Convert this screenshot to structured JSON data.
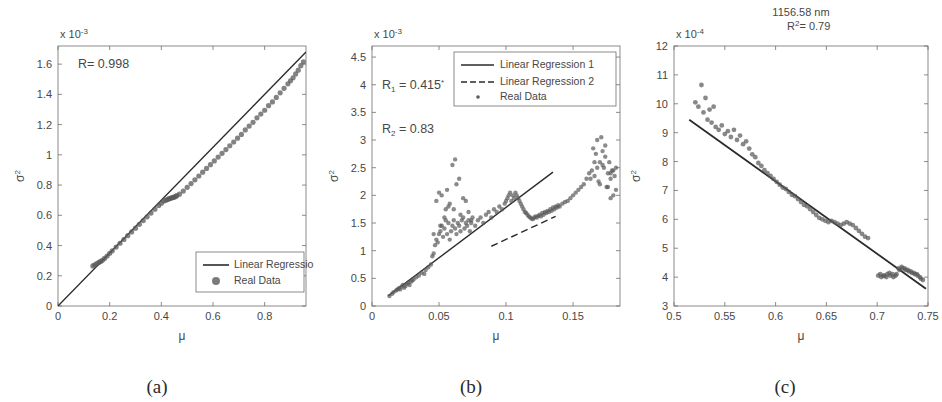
{
  "figure": {
    "background": "#ffffff",
    "axis_color": "#6e6e6e",
    "data_color": "#5a5a5a",
    "line_color": "#2b2b2b"
  },
  "panels": [
    {
      "id": "a",
      "caption": "(a)",
      "exponent_label": "x 10",
      "exponent_sup": "-3",
      "xlabel": "μ",
      "ylabel": "σ",
      "ylabel_sup": "2",
      "annotation": "R= 0.998",
      "xticks": [
        "0",
        "0.2",
        "0.4",
        "0.6",
        "0.8"
      ],
      "yticks": [
        "0",
        "0.2",
        "0.4",
        "0.6",
        "0.8",
        "1",
        "1.2",
        "1.4",
        "1.6"
      ],
      "legend": [
        {
          "label": "Linear Regression",
          "marker": "line"
        },
        {
          "label": "Real Data",
          "marker": "dot"
        }
      ]
    },
    {
      "id": "b",
      "caption": "(b)",
      "exponent_label": "x 10",
      "exponent_sup": "-3",
      "xlabel": "μ",
      "ylabel": "σ",
      "ylabel_sup": "2",
      "annotation_1": "R",
      "annotation_1_sub": "1",
      "annotation_1_val": " = 0.415",
      "annotation_1_mark": "*",
      "annotation_2": "R",
      "annotation_2_sub": "2",
      "annotation_2_val": " = 0.83",
      "xticks": [
        "0",
        "0.05",
        "0.1",
        "0.15"
      ],
      "yticks": [
        "0",
        "0.5",
        "1",
        "1.5",
        "2",
        "2.5",
        "3",
        "3.5",
        "4",
        "4.5"
      ],
      "legend": [
        {
          "label": "Linear Regression 1",
          "marker": "line"
        },
        {
          "label": "Linear Regression 2",
          "marker": "dashed"
        },
        {
          "label": "Real Data",
          "marker": "smalldot"
        }
      ]
    },
    {
      "id": "c",
      "caption": "(c)",
      "title_line1": "1156.58 nm",
      "title_line2": "R",
      "title_line2_sup": "2",
      "title_line2_val": "= 0.79",
      "exponent_label": "x 10",
      "exponent_sup": "-4",
      "xlabel": "μ",
      "ylabel": "σ",
      "ylabel_sup": "2",
      "xticks": [
        "0.5",
        "0.55",
        "0.6",
        "0.65",
        "0.7",
        "0.75"
      ],
      "yticks": [
        "3",
        "4",
        "5",
        "6",
        "7",
        "8",
        "9",
        "10",
        "11",
        "12"
      ]
    }
  ],
  "chart_data": [
    {
      "type": "scatter",
      "panel": "a",
      "title": "",
      "xlabel": "μ",
      "ylabel": "σ²",
      "y_multiplier": 0.001,
      "xlim": [
        0,
        0.96
      ],
      "ylim": [
        0,
        1.72
      ],
      "xticks": [
        0,
        0.2,
        0.4,
        0.6,
        0.8
      ],
      "yticks": [
        0,
        0.2,
        0.4,
        0.6,
        0.8,
        1.0,
        1.2,
        1.4,
        1.6
      ],
      "grid": false,
      "legend_position": "lower-right",
      "annotations": [
        {
          "text": "R= 0.998",
          "x": 0.1,
          "y": 1.6
        }
      ],
      "series": [
        {
          "name": "Linear Regression",
          "type": "line",
          "style": "solid",
          "x": [
            0,
            0.96
          ],
          "y": [
            0.0,
            1.68
          ]
        },
        {
          "name": "Real Data",
          "type": "scatter",
          "x": [
            0.135,
            0.142,
            0.15,
            0.158,
            0.165,
            0.172,
            0.18,
            0.19,
            0.2,
            0.21,
            0.225,
            0.24,
            0.255,
            0.27,
            0.285,
            0.3,
            0.315,
            0.33,
            0.345,
            0.36,
            0.375,
            0.39,
            0.4,
            0.41,
            0.418,
            0.425,
            0.43,
            0.435,
            0.44,
            0.445,
            0.45,
            0.455,
            0.46,
            0.47,
            0.485,
            0.5,
            0.515,
            0.53,
            0.545,
            0.56,
            0.575,
            0.59,
            0.605,
            0.62,
            0.635,
            0.65,
            0.665,
            0.68,
            0.695,
            0.71,
            0.725,
            0.74,
            0.755,
            0.77,
            0.785,
            0.8,
            0.815,
            0.83,
            0.845,
            0.86,
            0.875,
            0.89,
            0.9,
            0.91,
            0.92,
            0.93,
            0.94,
            0.95
          ],
          "y": [
            0.265,
            0.272,
            0.28,
            0.288,
            0.295,
            0.302,
            0.315,
            0.33,
            0.348,
            0.365,
            0.39,
            0.415,
            0.44,
            0.465,
            0.49,
            0.515,
            0.54,
            0.565,
            0.59,
            0.615,
            0.64,
            0.665,
            0.68,
            0.695,
            0.7,
            0.705,
            0.71,
            0.712,
            0.715,
            0.718,
            0.72,
            0.725,
            0.73,
            0.74,
            0.76,
            0.785,
            0.81,
            0.835,
            0.86,
            0.885,
            0.91,
            0.935,
            0.96,
            0.985,
            1.01,
            1.035,
            1.06,
            1.085,
            1.11,
            1.135,
            1.165,
            1.19,
            1.215,
            1.245,
            1.27,
            1.295,
            1.325,
            1.35,
            1.38,
            1.41,
            1.44,
            1.47,
            1.49,
            1.51,
            1.535,
            1.56,
            1.59,
            1.615
          ]
        }
      ]
    },
    {
      "type": "scatter",
      "panel": "b",
      "title": "",
      "xlabel": "μ",
      "ylabel": "σ²",
      "y_multiplier": 0.001,
      "xlim": [
        0,
        0.185
      ],
      "ylim": [
        0,
        4.7
      ],
      "xticks": [
        0,
        0.05,
        0.1,
        0.15
      ],
      "yticks": [
        0,
        0.5,
        1.0,
        1.5,
        2.0,
        2.5,
        3.0,
        3.5,
        4.0,
        4.5
      ],
      "grid": false,
      "legend_position": "upper-right",
      "annotations": [
        {
          "text": "R₁ = 0.415*",
          "x": 0.012,
          "y": 4.0
        },
        {
          "text": "R₂ = 0.83",
          "x": 0.012,
          "y": 3.2
        }
      ],
      "series": [
        {
          "name": "Linear Regression 1",
          "type": "line",
          "style": "solid",
          "x": [
            0.012,
            0.135
          ],
          "y": [
            0.18,
            2.42
          ]
        },
        {
          "name": "Linear Regression 2",
          "type": "line",
          "style": "dashed",
          "x": [
            0.089,
            0.137
          ],
          "y": [
            1.08,
            1.62
          ]
        },
        {
          "name": "Real Data",
          "type": "scatter",
          "x": [
            0.013,
            0.015,
            0.016,
            0.018,
            0.019,
            0.02,
            0.021,
            0.022,
            0.023,
            0.024,
            0.025,
            0.026,
            0.027,
            0.028,
            0.029,
            0.03,
            0.031,
            0.033,
            0.035,
            0.037,
            0.039,
            0.04,
            0.042,
            0.044,
            0.045,
            0.046,
            0.047,
            0.048,
            0.049,
            0.05,
            0.051,
            0.052,
            0.053,
            0.054,
            0.055,
            0.056,
            0.057,
            0.058,
            0.059,
            0.06,
            0.061,
            0.062,
            0.063,
            0.064,
            0.065,
            0.066,
            0.067,
            0.068,
            0.069,
            0.07,
            0.071,
            0.072,
            0.073,
            0.074,
            0.075,
            0.077,
            0.079,
            0.081,
            0.083,
            0.085,
            0.087,
            0.089,
            0.091,
            0.093,
            0.095,
            0.097,
            0.099,
            0.1,
            0.101,
            0.102,
            0.103,
            0.104,
            0.105,
            0.106,
            0.107,
            0.108,
            0.109,
            0.11,
            0.111,
            0.112,
            0.113,
            0.114,
            0.115,
            0.116,
            0.117,
            0.118,
            0.119,
            0.12,
            0.121,
            0.122,
            0.123,
            0.124,
            0.125,
            0.126,
            0.127,
            0.128,
            0.129,
            0.13,
            0.131,
            0.132,
            0.133,
            0.134,
            0.135,
            0.136,
            0.137,
            0.138,
            0.139,
            0.14,
            0.142,
            0.144,
            0.146,
            0.148,
            0.15,
            0.152,
            0.154,
            0.156,
            0.158,
            0.16,
            0.162,
            0.164,
            0.166,
            0.168,
            0.17,
            0.172,
            0.174,
            0.176,
            0.178,
            0.18,
            0.182,
            0.048,
            0.052,
            0.055,
            0.058,
            0.062,
            0.065,
            0.068,
            0.072,
            0.05,
            0.054,
            0.057,
            0.06,
            0.063,
            0.066,
            0.07,
            0.074,
            0.046,
            0.051,
            0.056,
            0.061,
            0.165,
            0.168,
            0.171,
            0.174,
            0.177,
            0.179,
            0.181,
            0.167,
            0.17,
            0.173,
            0.176,
            0.178,
            0.18,
            0.182,
            0.163,
            0.166,
            0.169,
            0.172,
            0.175,
            0.178
          ],
          "y": [
            0.18,
            0.22,
            0.25,
            0.28,
            0.3,
            0.32,
            0.3,
            0.35,
            0.38,
            0.33,
            0.36,
            0.4,
            0.42,
            0.38,
            0.44,
            0.46,
            0.48,
            0.52,
            0.55,
            0.6,
            0.58,
            0.65,
            0.7,
            0.75,
            0.9,
            0.95,
            1.1,
            1.2,
            1.15,
            1.3,
            1.35,
            1.45,
            1.25,
            1.4,
            1.55,
            1.3,
            1.5,
            1.2,
            1.35,
            1.45,
            1.55,
            1.4,
            1.3,
            1.5,
            1.45,
            1.35,
            1.55,
            1.6,
            1.4,
            1.5,
            1.45,
            1.55,
            1.35,
            1.5,
            1.6,
            1.45,
            1.55,
            1.6,
            1.5,
            1.65,
            1.7,
            1.6,
            1.75,
            1.7,
            1.8,
            1.75,
            1.85,
            1.9,
            1.95,
            2.0,
            2.05,
            1.9,
            2.0,
            1.95,
            2.05,
            2.0,
            1.95,
            1.9,
            1.85,
            1.8,
            1.75,
            1.7,
            1.68,
            1.65,
            1.62,
            1.6,
            1.58,
            1.57,
            1.6,
            1.62,
            1.6,
            1.63,
            1.65,
            1.62,
            1.68,
            1.65,
            1.7,
            1.68,
            1.72,
            1.7,
            1.75,
            1.72,
            1.78,
            1.75,
            1.8,
            1.78,
            1.82,
            1.8,
            1.85,
            1.88,
            1.9,
            1.95,
            2.0,
            2.05,
            2.1,
            2.15,
            2.2,
            2.3,
            2.4,
            2.45,
            2.35,
            2.5,
            2.6,
            2.55,
            2.7,
            2.4,
            2.3,
            2.45,
            2.5,
            1.9,
            2.0,
            1.75,
            1.85,
            2.65,
            2.3,
            1.95,
            1.7,
            2.05,
            1.6,
            1.8,
            2.55,
            2.2,
            1.65,
            1.9,
            1.55,
            1.3,
            1.45,
            2.1,
            1.75,
            2.85,
            3.0,
            3.05,
            2.9,
            2.6,
            2.45,
            2.35,
            2.75,
            2.2,
            2.5,
            2.15,
            2.4,
            2.0,
            2.1,
            2.3,
            2.6,
            2.25,
            2.8,
            2.15,
            1.95
          ]
        }
      ]
    },
    {
      "type": "scatter",
      "panel": "c",
      "title": "1156.58 nm / R²= 0.79",
      "xlabel": "μ",
      "ylabel": "σ²",
      "y_multiplier": 0.0001,
      "xlim": [
        0.5,
        0.75
      ],
      "ylim": [
        3,
        12
      ],
      "xticks": [
        0.5,
        0.55,
        0.6,
        0.65,
        0.7,
        0.75
      ],
      "yticks": [
        3,
        4,
        5,
        6,
        7,
        8,
        9,
        10,
        11,
        12
      ],
      "grid": false,
      "legend_position": "none",
      "series": [
        {
          "name": "Linear Regression",
          "type": "line",
          "style": "solid",
          "x": [
            0.515,
            0.748
          ],
          "y": [
            9.45,
            3.6
          ]
        },
        {
          "name": "Real Data",
          "type": "scatter",
          "x": [
            0.521,
            0.524,
            0.527,
            0.529,
            0.531,
            0.533,
            0.535,
            0.537,
            0.539,
            0.541,
            0.544,
            0.547,
            0.55,
            0.553,
            0.556,
            0.559,
            0.562,
            0.565,
            0.568,
            0.571,
            0.574,
            0.577,
            0.58,
            0.583,
            0.586,
            0.589,
            0.592,
            0.595,
            0.598,
            0.601,
            0.604,
            0.607,
            0.61,
            0.613,
            0.616,
            0.619,
            0.622,
            0.625,
            0.628,
            0.631,
            0.634,
            0.637,
            0.64,
            0.643,
            0.646,
            0.649,
            0.652,
            0.655,
            0.658,
            0.661,
            0.664,
            0.667,
            0.67,
            0.673,
            0.676,
            0.679,
            0.682,
            0.685,
            0.688,
            0.691,
            0.701,
            0.704,
            0.707,
            0.71,
            0.713,
            0.716,
            0.719,
            0.722,
            0.725,
            0.728,
            0.731,
            0.734,
            0.737,
            0.74,
            0.743,
            0.703,
            0.706,
            0.709,
            0.712,
            0.715,
            0.718,
            0.721,
            0.724,
            0.727,
            0.73,
            0.733,
            0.736,
            0.739,
            0.742,
            0.745
          ],
          "y": [
            10.05,
            9.9,
            10.65,
            9.7,
            10.2,
            9.45,
            9.8,
            9.35,
            9.9,
            9.2,
            9.1,
            9.25,
            8.95,
            9.05,
            8.85,
            9.1,
            8.75,
            8.9,
            8.6,
            8.7,
            8.45,
            8.25,
            8.15,
            7.95,
            7.85,
            7.7,
            7.6,
            7.5,
            7.4,
            7.3,
            7.2,
            7.1,
            7.05,
            6.95,
            6.85,
            6.8,
            6.7,
            6.6,
            6.5,
            6.45,
            6.35,
            6.25,
            6.15,
            6.05,
            6.0,
            5.95,
            5.9,
            5.95,
            5.9,
            5.85,
            5.8,
            5.85,
            5.9,
            5.85,
            5.8,
            5.7,
            5.6,
            5.5,
            5.4,
            5.35,
            4.05,
            4.0,
            4.05,
            4.1,
            4.05,
            4.0,
            4.1,
            4.25,
            4.3,
            4.25,
            4.2,
            4.15,
            4.1,
            4.05,
            3.95,
            4.1,
            4.05,
            4.0,
            4.15,
            4.1,
            4.05,
            4.3,
            4.35,
            4.3,
            4.25,
            4.2,
            4.15,
            4.1,
            4.0,
            3.9
          ]
        }
      ]
    }
  ]
}
